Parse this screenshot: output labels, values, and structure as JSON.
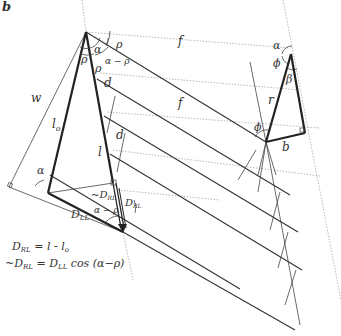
{
  "panel_label": "b",
  "labels": {
    "w": "w",
    "l_o": "l",
    "l_o_sub": "o",
    "l": "l",
    "d1": "d",
    "d2": "d",
    "f1": "f",
    "f2": "f",
    "rho_top": "ρ",
    "rho_left": "ρ",
    "rho_lower": "ρ",
    "alpha_top": "α",
    "alpha_minus_rho_top": "α − ρ",
    "alpha_base": "α",
    "alpha_minus_rho_bottom": "α − ρ",
    "neg_D_RL": "~D",
    "neg_D_RL_sub": "RL",
    "D_RL": "D",
    "D_RL_sub": "RL",
    "D_LL": "D",
    "D_LL_sub": "LL",
    "right_alpha": "α",
    "right_phi": "ϕ",
    "right_beta": "β",
    "right_r": "r",
    "right_b": "b",
    "right_phi_lower": "ϕ"
  },
  "equations": {
    "eq1_lhs": "D",
    "eq1_lhs_sub": "RL",
    "eq1_rhs": " =  l - l",
    "eq1_rhs_sub": "o",
    "eq2_lhs": "~D",
    "eq2_lhs_sub": "RL",
    "eq2_mid": " = D",
    "eq2_mid_sub": "LL",
    "eq2_rhs": " cos  (α−ρ)"
  }
}
